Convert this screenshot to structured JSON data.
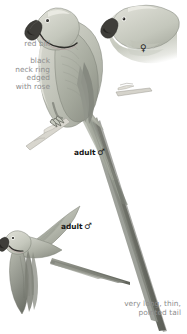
{
  "plate": {
    "title": "Rose-ringed Parakeet plate",
    "background_color": "#ffffff",
    "width": 187,
    "height": 334
  },
  "annotations": {
    "red_bill": "red bill",
    "neck_ring": "black\nneck ring\nedged\nwith rose",
    "tail": "very long, thin,\npointed tail",
    "label_color": "#8e8e8e"
  },
  "figures": {
    "perched_male": {
      "caption": "adult",
      "sex_symbol": "♂",
      "caption_color": "#161616"
    },
    "flying_male": {
      "caption": "adult",
      "sex_symbol": "♂",
      "caption_color": "#161616"
    },
    "female_head": {
      "sex_symbol": "♀",
      "caption_color": "#1a1a1a"
    }
  },
  "palette": {
    "body_light": "#d9dad2",
    "body_mid": "#b9bbb1",
    "body_dark": "#9b9e94",
    "wing_shade": "#8e9187",
    "outline": "#6b6d65",
    "bill_dark": "#3c3b38",
    "eye_dark": "#2b2a27",
    "tail_dark": "#6e7067",
    "neck_ring": "#2f2e2b",
    "branch": "#cfcdc6"
  }
}
